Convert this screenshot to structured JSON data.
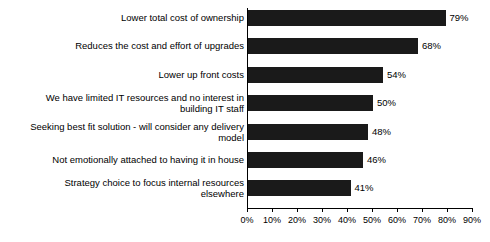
{
  "chart_data": {
    "type": "bar",
    "orientation": "horizontal",
    "title": "",
    "subtitle": "",
    "xlabel": "",
    "ylabel": "",
    "xlim": [
      0,
      90
    ],
    "grid": false,
    "legend": null,
    "bar_color": "#1a1a1a",
    "background_color": "#ffffff",
    "categories": [
      "Lower total cost of ownership",
      "Reduces the cost and effort of upgrades",
      "Lower up front costs",
      "We have limited IT resources and no interest in\nbuilding IT staff",
      "Seeking best fit solution - will consider any delivery\nmodel",
      "Not emotionally attached to having it in house",
      "Strategy choice to focus internal resources\nelsewhere"
    ],
    "values": [
      79,
      68,
      54,
      50,
      48,
      46,
      41
    ],
    "value_labels": [
      "79%",
      "68%",
      "54%",
      "50%",
      "48%",
      "46%",
      "41%"
    ],
    "xticks": [
      0,
      10,
      20,
      30,
      40,
      50,
      60,
      70,
      80,
      90
    ],
    "xtick_labels": [
      "0%",
      "10%",
      "20%",
      "30%",
      "40%",
      "50%",
      "60%",
      "70%",
      "80%",
      "90%"
    ]
  }
}
